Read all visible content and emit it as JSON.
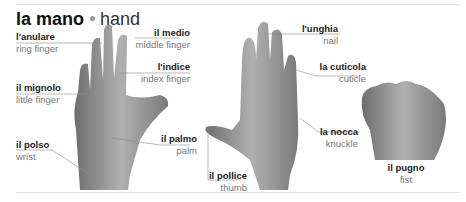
{
  "title": {
    "italian": "la mano",
    "english": "hand"
  },
  "labels": [
    {
      "id": "anulare",
      "italian": "l'anulare",
      "english": "ring finger"
    },
    {
      "id": "medio",
      "italian": "il medio",
      "english": "middle finger"
    },
    {
      "id": "indice",
      "italian": "l'indice",
      "english": "index finger"
    },
    {
      "id": "mignolo",
      "italian": "il mignolo",
      "english": "little finger"
    },
    {
      "id": "polso",
      "italian": "il polso",
      "english": "wrist"
    },
    {
      "id": "palmo",
      "italian": "il palmo",
      "english": "palm"
    },
    {
      "id": "pollice",
      "italian": "il pollice",
      "english": "thumb"
    },
    {
      "id": "unghia",
      "italian": "l'unghia",
      "english": "nail"
    },
    {
      "id": "cuticola",
      "italian": "la cuticola",
      "english": "cuticle"
    },
    {
      "id": "nocca",
      "italian": "la nocca",
      "english": "knuckle"
    },
    {
      "id": "pugno",
      "italian": "il pugno",
      "english": "fist"
    }
  ],
  "colors": {
    "dot": "#9a9a9a",
    "leader": "#8a8a8a",
    "skin": "#8c8c8c"
  }
}
